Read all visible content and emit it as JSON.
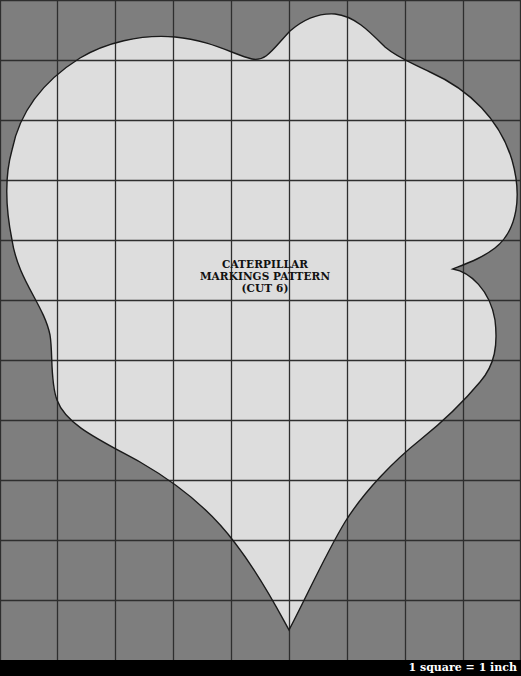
{
  "pattern": {
    "title_lines": [
      "CATERPILLAR",
      "MARKINGS PATTERN",
      "(CUT 6)"
    ],
    "scale_note": "1 square = 1 inch"
  },
  "grid": {
    "columns": 9,
    "rows": 11,
    "cell_width": 57.9,
    "cell_height": 60
  },
  "colors": {
    "background": "#7e7e7e",
    "shape_fill": "#dddddd",
    "grid_line": "#2e2e2e",
    "outline": "#1a1a1a",
    "footer": "#000000",
    "footer_text": "#ffffff"
  }
}
